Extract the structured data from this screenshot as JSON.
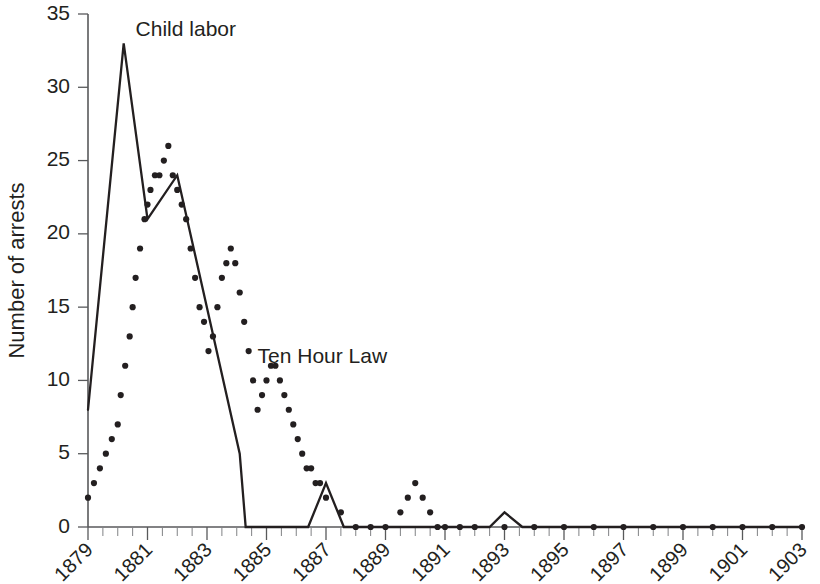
{
  "chart_data": {
    "type": "line",
    "title": "",
    "xlabel": "",
    "ylabel": "Number of arrests",
    "xlim": [
      1879,
      1903
    ],
    "ylim": [
      0,
      35
    ],
    "grid": false,
    "legend_position": "inline-annotation",
    "y_ticks": [
      0,
      5,
      10,
      15,
      20,
      25,
      30,
      35
    ],
    "y_tick_labels": [
      "0",
      "5",
      "10",
      "15",
      "20",
      "25",
      "30",
      "35"
    ],
    "x_ticks": [
      1879,
      1881,
      1883,
      1885,
      1887,
      1889,
      1891,
      1893,
      1895,
      1897,
      1899,
      1901,
      1903
    ],
    "x_tick_labels": [
      "1879",
      "1881",
      "1883",
      "1885",
      "1887",
      "1889",
      "1891",
      "1893",
      "1895",
      "1897",
      "1899",
      "1901",
      "1903"
    ],
    "x_minor_tick_step": 0.5,
    "annotations": [
      {
        "text": "Child labor",
        "x": 1880.6,
        "y": 33.5,
        "series": "Child labor"
      },
      {
        "text": "Ten Hour Law",
        "x": 1884.7,
        "y": 11.2,
        "series": "Ten Hour Law"
      }
    ],
    "series": [
      {
        "name": "Child labor",
        "style": "solid-line",
        "color": "#231f20",
        "x": [
          1879.0,
          1880.2,
          1881.0,
          1882.0,
          1884.1,
          1884.3,
          1886.4,
          1887.0,
          1887.6,
          1891.0,
          1892.5,
          1893.0,
          1893.6,
          1903.0
        ],
        "values": [
          8,
          33,
          21,
          24,
          5,
          0,
          0,
          3,
          0,
          0,
          0,
          1,
          0,
          0
        ]
      },
      {
        "name": "Ten Hour Law",
        "style": "dotted",
        "color": "#231f20",
        "x": [
          1879.0,
          1879.2,
          1879.4,
          1879.6,
          1879.8,
          1880.0,
          1880.1,
          1880.25,
          1880.4,
          1880.5,
          1880.6,
          1880.75,
          1880.9,
          1881.0,
          1881.1,
          1881.25,
          1881.4,
          1881.55,
          1881.7,
          1881.85,
          1882.0,
          1882.15,
          1882.3,
          1882.45,
          1882.6,
          1882.75,
          1882.9,
          1883.05,
          1883.2,
          1883.35,
          1883.5,
          1883.65,
          1883.8,
          1883.95,
          1884.1,
          1884.25,
          1884.4,
          1884.55,
          1884.7,
          1884.85,
          1885.0,
          1885.15,
          1885.3,
          1885.45,
          1885.6,
          1885.75,
          1885.9,
          1886.05,
          1886.2,
          1886.35,
          1886.5,
          1886.65,
          1886.8,
          1887.0,
          1887.5,
          1888.0,
          1888.5,
          1889.0,
          1889.5,
          1889.75,
          1890.0,
          1890.25,
          1890.5,
          1890.75,
          1891.0,
          1891.5,
          1892.0,
          1893.0,
          1894.0,
          1895.0,
          1896.0,
          1897.0,
          1898.0,
          1899.0,
          1900.0,
          1901.0,
          1902.0,
          1903.0
        ],
        "values": [
          2,
          3,
          4,
          5,
          6,
          7,
          9,
          11,
          13,
          15,
          17,
          19,
          21,
          22,
          23,
          24,
          24,
          25,
          26,
          24,
          23,
          22,
          21,
          19,
          17,
          15,
          14,
          12,
          13,
          15,
          17,
          18,
          19,
          18,
          16,
          14,
          12,
          10,
          8,
          9,
          10,
          11,
          11,
          10,
          9,
          8,
          7,
          6,
          5,
          4,
          4,
          3,
          3,
          2,
          1,
          0,
          0,
          0,
          1,
          2,
          3,
          2,
          1,
          0,
          0,
          0,
          0,
          0,
          0,
          0,
          0,
          0,
          0,
          0,
          0,
          0,
          0,
          0
        ]
      }
    ]
  }
}
